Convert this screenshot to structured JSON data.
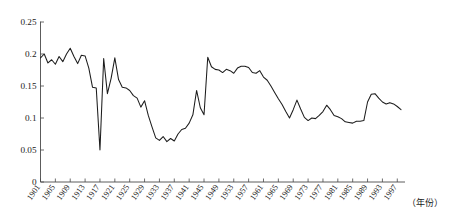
{
  "chart_data": {
    "type": "line",
    "title": "",
    "subtitle": "",
    "xlabel": "（年份）",
    "ylabel": "",
    "xlim": [
      1901,
      1998
    ],
    "ylim": [
      0,
      0.25
    ],
    "grid": false,
    "legend": null,
    "y_ticks": [
      0,
      0.05,
      0.1,
      0.15,
      0.2,
      0.25
    ],
    "y_tick_labels": [
      "0",
      "0.05",
      "0.1",
      "0.15",
      "0.2",
      "0.25"
    ],
    "x_tick_labels": [
      "1901",
      "1905",
      "1909",
      "1913",
      "1917",
      "1921",
      "1925",
      "1929",
      "1933",
      "1937",
      "1941",
      "1945",
      "1949",
      "1953",
      "1957",
      "1961",
      "1965",
      "1969",
      "1973",
      "1977",
      "1981",
      "1985",
      "1989",
      "1993",
      "1997"
    ],
    "x_tick_values": [
      1901,
      1905,
      1909,
      1913,
      1917,
      1921,
      1925,
      1929,
      1933,
      1937,
      1941,
      1945,
      1949,
      1953,
      1957,
      1961,
      1965,
      1969,
      1973,
      1977,
      1981,
      1985,
      1989,
      1993,
      1997
    ],
    "series": [
      {
        "name": "series-1",
        "color": "#1c1c1c",
        "x": [
          1901,
          1902,
          1903,
          1904,
          1905,
          1906,
          1907,
          1908,
          1909,
          1910,
          1911,
          1912,
          1913,
          1914,
          1915,
          1916,
          1917,
          1918,
          1919,
          1920,
          1921,
          1922,
          1923,
          1924,
          1925,
          1926,
          1927,
          1928,
          1929,
          1930,
          1931,
          1932,
          1933,
          1934,
          1935,
          1936,
          1937,
          1938,
          1939,
          1940,
          1941,
          1942,
          1943,
          1944,
          1945,
          1946,
          1947,
          1948,
          1949,
          1950,
          1951,
          1952,
          1953,
          1954,
          1955,
          1956,
          1957,
          1958,
          1959,
          1960,
          1961,
          1962,
          1963,
          1964,
          1965,
          1966,
          1967,
          1968,
          1969,
          1970,
          1971,
          1972,
          1973,
          1974,
          1975,
          1976,
          1977,
          1978,
          1979,
          1980,
          1981,
          1982,
          1983,
          1984,
          1985,
          1986,
          1987,
          1988,
          1989,
          1990,
          1991,
          1992,
          1993,
          1994,
          1995,
          1996,
          1997,
          1998
        ],
        "values": [
          0.194,
          0.2,
          0.186,
          0.191,
          0.184,
          0.196,
          0.188,
          0.2,
          0.209,
          0.196,
          0.185,
          0.198,
          0.197,
          0.178,
          0.148,
          0.147,
          0.05,
          0.193,
          0.138,
          0.162,
          0.194,
          0.16,
          0.148,
          0.147,
          0.143,
          0.135,
          0.131,
          0.117,
          0.127,
          0.104,
          0.086,
          0.069,
          0.065,
          0.071,
          0.063,
          0.068,
          0.064,
          0.075,
          0.082,
          0.084,
          0.092,
          0.105,
          0.143,
          0.116,
          0.105,
          0.195,
          0.18,
          0.176,
          0.175,
          0.171,
          0.176,
          0.174,
          0.17,
          0.178,
          0.181,
          0.181,
          0.179,
          0.171,
          0.17,
          0.174,
          0.164,
          0.159,
          0.15,
          0.14,
          0.13,
          0.121,
          0.11,
          0.1,
          0.113,
          0.128,
          0.114,
          0.101,
          0.096,
          0.1,
          0.099,
          0.104,
          0.11,
          0.12,
          0.113,
          0.104,
          0.102,
          0.099,
          0.094,
          0.093,
          0.092,
          0.095,
          0.095,
          0.096,
          0.125,
          0.137,
          0.138,
          0.131,
          0.125,
          0.122,
          0.124,
          0.122,
          0.118,
          0.113
        ]
      }
    ]
  }
}
